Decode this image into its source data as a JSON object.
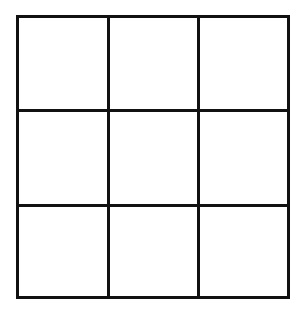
{
  "diagram": {
    "type": "grid",
    "rows": 3,
    "columns": 3,
    "line_color": "#111111",
    "background": "#ffffff",
    "cells": [
      [
        "",
        "",
        ""
      ],
      [
        "",
        "",
        ""
      ],
      [
        "",
        "",
        ""
      ]
    ]
  }
}
